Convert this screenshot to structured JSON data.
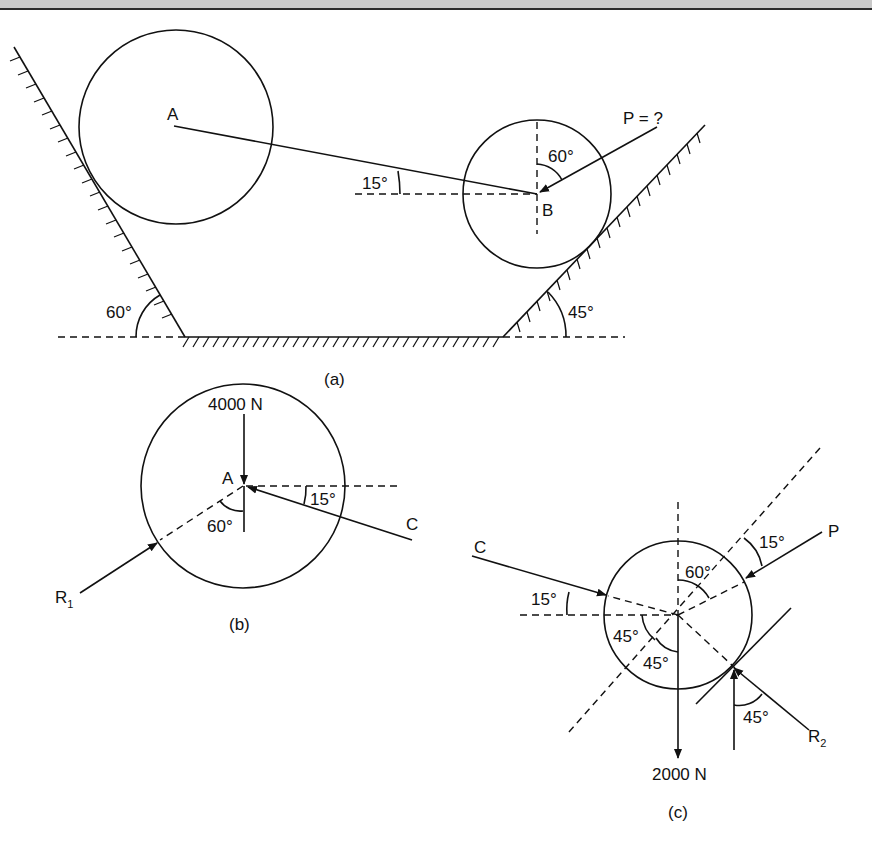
{
  "figure_a": {
    "caption": "(a)",
    "center_a_label": "A",
    "center_b_label": "B",
    "force_label": "P = ?",
    "angle_left_wall": "60°",
    "angle_right_wall": "45°",
    "angle_ab": "15°",
    "angle_p": "60°"
  },
  "figure_b": {
    "caption": "(b)",
    "center_label": "A",
    "weight_label": "4000 N",
    "reaction_label": "R",
    "reaction_sub": "1",
    "force_c_label": "C",
    "angle_c": "15°",
    "angle_r": "60°"
  },
  "figure_c": {
    "caption": "(c)",
    "weight_label": "2000 N",
    "force_c_label": "C",
    "force_p_label": "P",
    "reaction_label": "R",
    "reaction_sub": "2",
    "angle_c": "15°",
    "angle_p": "15°",
    "angle_60": "60°",
    "angle_45a": "45°",
    "angle_45b": "45°",
    "angle_r2": "45°"
  }
}
